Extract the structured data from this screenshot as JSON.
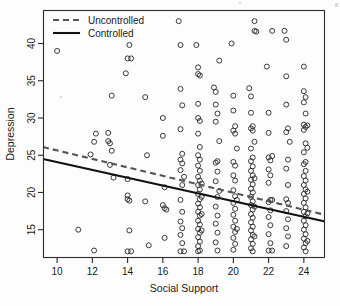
{
  "figure": {
    "background": "#fdfdfd",
    "plot_box": {
      "left": 43,
      "top": 10,
      "right": 325,
      "bottom": 258
    }
  },
  "chart_data": {
    "type": "scatter",
    "title": "",
    "xlabel": "Social Support",
    "ylabel": "Depression",
    "xlim": [
      9.2,
      25.2
    ],
    "ylim": [
      11.2,
      44.5
    ],
    "xticks": [
      10,
      12,
      14,
      16,
      18,
      20,
      22,
      24
    ],
    "yticks": [
      15,
      20,
      25,
      30,
      35,
      40
    ],
    "xtick_labels": [
      "10",
      "12",
      "14",
      "16",
      "18",
      "20",
      "22",
      "24"
    ],
    "ytick_labels": [
      "15",
      "20",
      "25",
      "30",
      "35",
      "40"
    ],
    "grid": false,
    "marker": "open-circle",
    "marker_color": "#2f2f2f",
    "legend": {
      "position": "top-left",
      "entries": [
        {
          "name": "Uncontrolled",
          "style": "dashed",
          "color": "#555555"
        },
        {
          "name": "Controlled",
          "style": "solid",
          "color": "#111111"
        }
      ]
    },
    "series": [
      {
        "name": "Uncontrolled",
        "type": "line",
        "style": "dashed",
        "color": "#555555",
        "endpoints": [
          {
            "x": 9.2,
            "y": 26.1
          },
          {
            "x": 25.2,
            "y": 17.0
          }
        ],
        "slope": -0.57,
        "intercept": 31.3
      },
      {
        "name": "Controlled",
        "type": "line",
        "style": "solid",
        "color": "#111111",
        "endpoints": [
          {
            "x": 9.2,
            "y": 24.5
          },
          {
            "x": 25.2,
            "y": 16.1
          }
        ],
        "slope": -0.525,
        "intercept": 29.3
      }
    ],
    "points": [
      [
        10.0,
        39.0
      ],
      [
        11.2,
        15.0
      ],
      [
        11.9,
        25.1
      ],
      [
        12.1,
        26.8
      ],
      [
        12.2,
        27.9
      ],
      [
        12.1,
        12.2
      ],
      [
        12.9,
        28.0
      ],
      [
        12.9,
        26.9
      ],
      [
        13.0,
        26.6
      ],
      [
        13.1,
        33.0
      ],
      [
        13.1,
        25.6
      ],
      [
        13.2,
        22.0
      ],
      [
        13.0,
        23.7
      ],
      [
        13.9,
        36.0
      ],
      [
        14.0,
        21.8
      ],
      [
        14.0,
        19.6
      ],
      [
        14.0,
        19.1
      ],
      [
        14.1,
        18.9
      ],
      [
        14.1,
        14.9
      ],
      [
        14.0,
        12.1
      ],
      [
        14.2,
        12.1
      ],
      [
        14.1,
        39.8
      ],
      [
        14.2,
        38.0
      ],
      [
        14.0,
        38.0
      ],
      [
        15.0,
        32.8
      ],
      [
        15.1,
        25.0
      ],
      [
        15.0,
        18.8
      ],
      [
        15.2,
        12.9
      ],
      [
        16.0,
        30.0
      ],
      [
        16.0,
        27.6
      ],
      [
        16.1,
        20.7
      ],
      [
        16.0,
        18.3
      ],
      [
        16.1,
        17.9
      ],
      [
        16.2,
        17.7
      ],
      [
        16.1,
        13.9
      ],
      [
        16.9,
        43.0
      ],
      [
        17.0,
        39.8
      ],
      [
        17.0,
        33.9
      ],
      [
        17.1,
        31.7
      ],
      [
        17.0,
        28.5
      ],
      [
        17.1,
        25.2
      ],
      [
        17.0,
        24.4
      ],
      [
        17.1,
        23.9
      ],
      [
        17.0,
        23.0
      ],
      [
        17.2,
        22.1
      ],
      [
        17.1,
        21.0
      ],
      [
        17.0,
        19.0
      ],
      [
        17.1,
        17.4
      ],
      [
        17.0,
        16.1
      ],
      [
        17.1,
        15.2
      ],
      [
        17.0,
        14.3
      ],
      [
        17.1,
        13.2
      ],
      [
        17.0,
        12.1
      ],
      [
        17.2,
        12.1
      ],
      [
        17.9,
        39.8
      ],
      [
        18.0,
        36.8
      ],
      [
        18.0,
        35.9
      ],
      [
        18.1,
        35.7
      ],
      [
        18.0,
        31.9
      ],
      [
        18.0,
        30.0
      ],
      [
        18.1,
        29.6
      ],
      [
        18.0,
        27.9
      ],
      [
        18.1,
        26.1
      ],
      [
        18.0,
        25.0
      ],
      [
        18.1,
        24.4
      ],
      [
        18.0,
        23.6
      ],
      [
        18.1,
        22.9
      ],
      [
        18.0,
        22.1
      ],
      [
        18.1,
        21.6
      ],
      [
        18.0,
        21.0
      ],
      [
        18.1,
        20.4
      ],
      [
        18.0,
        19.8
      ],
      [
        18.1,
        19.1
      ],
      [
        18.0,
        18.5
      ],
      [
        18.1,
        18.0
      ],
      [
        18.0,
        17.4
      ],
      [
        18.1,
        16.9
      ],
      [
        18.0,
        16.2
      ],
      [
        18.1,
        15.7
      ],
      [
        18.0,
        15.1
      ],
      [
        18.1,
        14.6
      ],
      [
        18.0,
        14.0
      ],
      [
        18.1,
        13.4
      ],
      [
        18.0,
        12.8
      ],
      [
        18.1,
        12.2
      ],
      [
        18.0,
        12.1
      ],
      [
        18.2,
        21.2
      ],
      [
        18.2,
        19.4
      ],
      [
        18.2,
        17.1
      ],
      [
        18.2,
        14.9
      ],
      [
        18.9,
        34.1
      ],
      [
        19.0,
        33.5
      ],
      [
        19.0,
        31.8
      ],
      [
        19.1,
        30.6
      ],
      [
        19.0,
        29.5
      ],
      [
        19.1,
        24.2
      ],
      [
        19.0,
        24.0
      ],
      [
        19.1,
        22.8
      ],
      [
        19.0,
        21.5
      ],
      [
        19.1,
        19.4
      ],
      [
        19.0,
        18.1
      ],
      [
        19.1,
        16.9
      ],
      [
        19.0,
        15.8
      ],
      [
        19.1,
        14.6
      ],
      [
        19.0,
        13.3
      ],
      [
        19.1,
        12.2
      ],
      [
        19.2,
        37.7
      ],
      [
        19.2,
        26.9
      ],
      [
        19.2,
        20.2
      ],
      [
        19.9,
        40.0
      ],
      [
        20.0,
        33.0
      ],
      [
        20.0,
        31.0
      ],
      [
        20.1,
        28.9
      ],
      [
        20.0,
        28.3
      ],
      [
        20.1,
        27.9
      ],
      [
        20.0,
        24.1
      ],
      [
        20.1,
        23.6
      ],
      [
        20.0,
        22.3
      ],
      [
        20.1,
        21.6
      ],
      [
        20.0,
        20.3
      ],
      [
        20.1,
        19.5
      ],
      [
        20.0,
        18.6
      ],
      [
        20.1,
        17.8
      ],
      [
        20.0,
        17.0
      ],
      [
        20.1,
        16.2
      ],
      [
        20.0,
        15.4
      ],
      [
        20.1,
        14.7
      ],
      [
        20.0,
        13.9
      ],
      [
        20.1,
        13.1
      ],
      [
        20.0,
        12.3
      ],
      [
        20.2,
        25.9
      ],
      [
        20.2,
        19.0
      ],
      [
        20.2,
        15.1
      ],
      [
        20.9,
        34.0
      ],
      [
        21.0,
        32.9
      ],
      [
        21.0,
        30.7
      ],
      [
        21.1,
        28.9
      ],
      [
        21.0,
        28.6
      ],
      [
        21.1,
        28.3
      ],
      [
        21.0,
        25.9
      ],
      [
        21.1,
        24.7
      ],
      [
        21.0,
        24.2
      ],
      [
        21.1,
        23.5
      ],
      [
        21.0,
        22.9
      ],
      [
        21.1,
        22.3
      ],
      [
        21.0,
        21.7
      ],
      [
        21.1,
        21.1
      ],
      [
        21.0,
        20.5
      ],
      [
        21.1,
        20.0
      ],
      [
        21.0,
        19.4
      ],
      [
        21.1,
        18.8
      ],
      [
        21.0,
        18.3
      ],
      [
        21.1,
        17.7
      ],
      [
        21.0,
        17.1
      ],
      [
        21.1,
        16.6
      ],
      [
        21.0,
        16.0
      ],
      [
        21.1,
        15.4
      ],
      [
        21.0,
        14.9
      ],
      [
        21.1,
        14.3
      ],
      [
        21.0,
        13.7
      ],
      [
        21.1,
        13.1
      ],
      [
        21.0,
        12.5
      ],
      [
        21.1,
        12.1
      ],
      [
        21.2,
        43.0
      ],
      [
        21.2,
        41.7
      ],
      [
        21.3,
        41.6
      ],
      [
        21.2,
        26.8
      ],
      [
        21.2,
        21.9
      ],
      [
        21.2,
        18.1
      ],
      [
        21.2,
        14.1
      ],
      [
        21.9,
        36.9
      ],
      [
        22.0,
        30.7
      ],
      [
        22.0,
        28.0
      ],
      [
        22.0,
        24.7
      ],
      [
        22.1,
        24.3
      ],
      [
        22.0,
        23.1
      ],
      [
        22.1,
        22.3
      ],
      [
        22.0,
        21.3
      ],
      [
        22.1,
        19.0
      ],
      [
        22.0,
        18.7
      ],
      [
        22.1,
        17.6
      ],
      [
        22.0,
        16.7
      ],
      [
        22.1,
        15.6
      ],
      [
        22.0,
        14.4
      ],
      [
        22.1,
        13.2
      ],
      [
        22.0,
        12.2
      ],
      [
        22.2,
        41.7
      ],
      [
        22.2,
        24.9
      ],
      [
        22.2,
        19.0
      ],
      [
        22.2,
        12.2
      ],
      [
        22.9,
        41.7
      ],
      [
        23.0,
        40.5
      ],
      [
        23.0,
        35.6
      ],
      [
        23.0,
        31.8
      ],
      [
        23.1,
        28.6
      ],
      [
        23.0,
        28.1
      ],
      [
        23.1,
        24.4
      ],
      [
        23.0,
        23.2
      ],
      [
        23.1,
        21.0
      ],
      [
        23.0,
        19.1
      ],
      [
        23.1,
        18.6
      ],
      [
        23.0,
        17.5
      ],
      [
        23.1,
        16.4
      ],
      [
        23.0,
        15.2
      ],
      [
        23.1,
        14.1
      ],
      [
        23.0,
        12.8
      ],
      [
        23.2,
        26.8
      ],
      [
        24.0,
        36.9
      ],
      [
        24.0,
        33.6
      ],
      [
        24.1,
        32.8
      ],
      [
        24.0,
        32.1
      ],
      [
        24.1,
        30.6
      ],
      [
        24.0,
        29.1
      ],
      [
        24.1,
        28.8
      ],
      [
        24.0,
        28.4
      ],
      [
        24.1,
        26.6
      ],
      [
        24.0,
        25.4
      ],
      [
        24.1,
        24.1
      ],
      [
        24.0,
        23.8
      ],
      [
        24.1,
        22.9
      ],
      [
        24.0,
        22.2
      ],
      [
        24.1,
        21.6
      ],
      [
        24.0,
        21.0
      ],
      [
        24.1,
        20.4
      ],
      [
        24.0,
        19.8
      ],
      [
        24.1,
        19.2
      ],
      [
        24.0,
        18.6
      ],
      [
        24.1,
        18.0
      ],
      [
        24.0,
        17.4
      ],
      [
        24.1,
        16.8
      ],
      [
        24.0,
        16.2
      ],
      [
        24.1,
        15.6
      ],
      [
        24.0,
        15.0
      ],
      [
        24.1,
        14.4
      ],
      [
        24.0,
        13.8
      ],
      [
        24.1,
        13.2
      ],
      [
        24.0,
        12.6
      ],
      [
        24.1,
        12.1
      ],
      [
        24.2,
        29.0
      ],
      [
        24.2,
        26.0
      ],
      [
        24.2,
        20.1
      ],
      [
        24.2,
        17.2
      ],
      [
        24.2,
        13.5
      ]
    ]
  }
}
